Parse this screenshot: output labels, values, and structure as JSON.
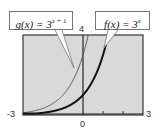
{
  "chart_data": {
    "type": "line",
    "title": "",
    "xlabel": "",
    "ylabel": "",
    "xlim": [
      -3,
      3
    ],
    "ylim": [
      0,
      4
    ],
    "grid": false,
    "tick_labels": {
      "x_min": "-3",
      "x_max": "3",
      "x_origin": "0",
      "y_max": "4"
    },
    "x_ticks": [
      1,
      2
    ],
    "series": [
      {
        "name": "g(x) = 3^(x+1)",
        "label_prefix": "g(x) = 3",
        "label_exponent": "x + 1",
        "formula": "3^(x+1)",
        "style": "thin",
        "x": [
          -3,
          -2,
          -1,
          -0.5,
          0,
          0.26
        ],
        "values": [
          0.11,
          0.33,
          1,
          1.73,
          3,
          4
        ]
      },
      {
        "name": "f(x) = 3^x",
        "label_prefix": "f(x) = 3",
        "label_exponent": "x",
        "formula": "3^x",
        "style": "thick",
        "x": [
          -3,
          -2,
          -1,
          0,
          0.5,
          1,
          1.26
        ],
        "values": [
          0.04,
          0.11,
          0.33,
          1,
          1.73,
          3,
          4
        ]
      }
    ]
  },
  "colors": {
    "plot_bg": "#d9d9d9",
    "frame": "#444444",
    "g_curve": "#555555",
    "f_curve": "#111111"
  }
}
